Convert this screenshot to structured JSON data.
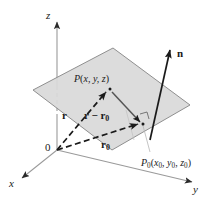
{
  "figure": {
    "background_color": "#ffffff",
    "plane_fill_color": "#d8d8d8",
    "plane_stroke_color": "#8a8a8a",
    "axis_color": "#9a9a9a",
    "vector_color": "#1a1a1a",
    "label_color": "#1a1a1a"
  },
  "axes": {
    "x": {
      "label": "x",
      "arrow": "x-axis-arrow"
    },
    "y": {
      "label": "y",
      "arrow": "y-axis-arrow"
    },
    "z": {
      "label": "z",
      "arrow": "z-axis-arrow"
    },
    "origin": {
      "label": "0"
    }
  },
  "points": {
    "P": {
      "name": "P",
      "coords_open": "(",
      "coords": "x, y, z",
      "coords_close": ")",
      "full_label": "P(x, y, z)"
    },
    "P0": {
      "name": "P",
      "name_sub": "0",
      "coords_open": "(",
      "x": "x",
      "x_sub": "0",
      "y": "y",
      "y_sub": "0",
      "z": "z",
      "z_sub": "0",
      "sep": ", ",
      "coords_close": ")",
      "full_label": "P0(x0, y0, z0)"
    }
  },
  "vectors": {
    "r": {
      "label": "r",
      "style": "dashed",
      "from": "origin",
      "to": "P"
    },
    "r_minus_r0": {
      "label_main": "r",
      "label_minus": " − ",
      "label_second": "r",
      "label_second_sub": "0",
      "style": "solid",
      "from": "P",
      "to": "P0"
    },
    "r0": {
      "label": "r",
      "label_sub": "0",
      "style": "dashed",
      "from": "origin",
      "to": "P0"
    },
    "n": {
      "label": "n",
      "style": "solid",
      "description": "normal-vector"
    }
  },
  "markers": {
    "right_angle": {
      "name": "right-angle-marker",
      "at": "P0"
    }
  }
}
